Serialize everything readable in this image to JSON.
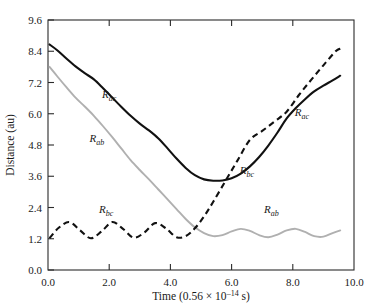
{
  "chart_data": {
    "type": "line",
    "title": "",
    "xlabel": "Time (0.56 × 10⁻¹⁴ s)",
    "ylabel": "Distance (au)",
    "xlim": [
      0.0,
      10.0
    ],
    "ylim": [
      0.0,
      9.6
    ],
    "xticks": [
      "0.0",
      "2.0",
      "4.0",
      "6.0",
      "8.0",
      "10.0"
    ],
    "xtick_values": [
      0.0,
      2.0,
      4.0,
      6.0,
      8.0,
      10.0
    ],
    "yticks": [
      "0.0",
      "1.2",
      "2.4",
      "3.6",
      "4.8",
      "6.0",
      "7.2",
      "8.4",
      "9.6"
    ],
    "ytick_values": [
      0.0,
      1.2,
      2.4,
      3.6,
      4.8,
      6.0,
      7.2,
      8.4,
      9.6
    ],
    "grid": false,
    "legend": "inline-annotations",
    "series": [
      {
        "name": "R_ac",
        "style": "solid",
        "color": "#111111",
        "x": [
          0.05,
          0.3,
          0.6,
          0.9,
          1.2,
          1.5,
          1.8,
          2.1,
          2.4,
          2.7,
          3.0,
          3.3,
          3.6,
          3.9,
          4.2,
          4.5,
          4.8,
          5.1,
          5.4,
          5.7,
          6.0,
          6.3,
          6.6,
          6.9,
          7.2,
          7.5,
          7.8,
          8.1,
          8.4,
          8.7,
          9.0,
          9.3,
          9.55
        ],
        "y": [
          8.66,
          8.44,
          8.12,
          7.82,
          7.56,
          7.32,
          6.98,
          6.62,
          6.26,
          5.92,
          5.62,
          5.36,
          5.06,
          4.68,
          4.28,
          3.92,
          3.64,
          3.48,
          3.43,
          3.44,
          3.52,
          3.7,
          3.98,
          4.34,
          4.78,
          5.28,
          5.82,
          6.22,
          6.56,
          6.86,
          7.08,
          7.28,
          7.46
        ]
      },
      {
        "name": "R_ab",
        "style": "solid",
        "color": "#b0b0b0",
        "x": [
          0.05,
          0.3,
          0.6,
          0.9,
          1.2,
          1.5,
          1.8,
          2.1,
          2.4,
          2.7,
          3.0,
          3.3,
          3.6,
          3.9,
          4.2,
          4.5,
          4.8,
          5.1,
          5.4,
          5.7,
          6.0,
          6.3,
          6.6,
          6.9,
          7.2,
          7.5,
          7.8,
          8.1,
          8.4,
          8.7,
          9.0,
          9.3,
          9.55
        ],
        "y": [
          7.8,
          7.44,
          7.02,
          6.62,
          6.28,
          5.92,
          5.52,
          5.1,
          4.66,
          4.22,
          3.84,
          3.48,
          3.1,
          2.72,
          2.34,
          1.96,
          1.64,
          1.42,
          1.3,
          1.34,
          1.48,
          1.58,
          1.5,
          1.34,
          1.26,
          1.36,
          1.52,
          1.58,
          1.46,
          1.3,
          1.28,
          1.42,
          1.52
        ]
      },
      {
        "name": "R_bc",
        "style": "dashed",
        "color": "#111111",
        "x": [
          0.05,
          0.35,
          0.7,
          1.05,
          1.4,
          1.75,
          2.1,
          2.45,
          2.8,
          3.15,
          3.5,
          3.85,
          4.2,
          4.5,
          4.8,
          5.1,
          5.4,
          5.8,
          6.2,
          6.6,
          7.0,
          7.4,
          7.8,
          8.2,
          8.6,
          9.0,
          9.4,
          9.55
        ],
        "y": [
          1.22,
          1.62,
          1.84,
          1.52,
          1.22,
          1.48,
          1.84,
          1.58,
          1.24,
          1.44,
          1.8,
          1.6,
          1.26,
          1.3,
          1.6,
          2.06,
          2.62,
          3.42,
          4.22,
          5.0,
          5.34,
          5.7,
          6.08,
          6.72,
          7.3,
          7.86,
          8.4,
          8.5
        ]
      }
    ],
    "annotations": [
      {
        "text": "R",
        "sub": "ac",
        "x": 2.0,
        "y": 6.6,
        "name": "label-rac-left"
      },
      {
        "text": "R",
        "sub": "ab",
        "x": 1.6,
        "y": 4.9,
        "name": "label-rab-left"
      },
      {
        "text": "R",
        "sub": "bc",
        "x": 1.9,
        "y": 2.2,
        "name": "label-rbc-left"
      },
      {
        "text": "R",
        "sub": "ac",
        "x": 8.3,
        "y": 5.9,
        "name": "label-rac-right"
      },
      {
        "text": "R",
        "sub": "bc",
        "x": 6.5,
        "y": 3.7,
        "name": "label-rbc-right"
      },
      {
        "text": "R",
        "sub": "ab",
        "x": 7.3,
        "y": 2.2,
        "name": "label-rab-right"
      }
    ]
  },
  "axes": {
    "ylabel": "Distance (au)",
    "xlabel_parts": {
      "prefix": "Time (0.56 × 10",
      "exponent": "–14",
      "suffix": " s)"
    }
  },
  "colors": {
    "solid_dark": "#111111",
    "solid_gray": "#b0b0b0",
    "frame": "#2b2b2b",
    "background": "#ffffff"
  }
}
